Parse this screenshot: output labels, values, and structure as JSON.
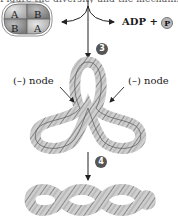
{
  "figure": {
    "top_text": "Figure the diversity and the mechanism is",
    "enzyme": {
      "subunits": [
        "A",
        "B",
        "B",
        "A"
      ]
    },
    "products": {
      "adp_label": "ADP +",
      "phosphate_label": "P"
    },
    "steps": [
      {
        "number": "3"
      },
      {
        "number": "4"
      }
    ],
    "node_labels": {
      "left": "(–) node",
      "right": "(–) node"
    },
    "colors": {
      "dna_fill": "#c8c8c8",
      "dna_stroke": "#555555",
      "step_badge": "#555555",
      "enzyme_light": "#d4d4d4",
      "enzyme_dark": "#9a9a9a"
    }
  }
}
